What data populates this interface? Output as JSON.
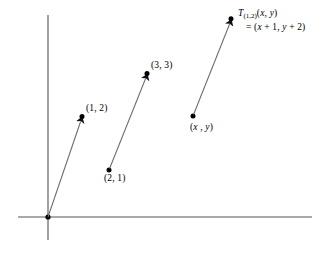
{
  "figure": {
    "background_color": "#ffffff",
    "axis_color": "#555555",
    "vector_color": "#666666",
    "point_color": "#000000",
    "text_color": "#000000",
    "width": 330,
    "height": 257
  },
  "axes": {
    "origin": {
      "x": 48,
      "y": 217
    },
    "x_axis": {
      "x1": 18,
      "y1": 217,
      "x2": 312,
      "y2": 217
    },
    "y_axis": {
      "x1": 48,
      "y1": 15,
      "x2": 48,
      "y2": 240
    }
  },
  "vectors": [
    {
      "name": "vector-origin-to-1-2",
      "start": {
        "x": 48,
        "y": 217
      },
      "end": {
        "x": 82,
        "y": 117
      },
      "start_label": "",
      "end_label": "(1, 2)"
    },
    {
      "name": "vector-2-1-to-3-3",
      "start": {
        "x": 109,
        "y": 170
      },
      "end": {
        "x": 147,
        "y": 74
      },
      "start_label": "(2, 1)",
      "end_label": "(3, 3)"
    },
    {
      "name": "vector-xy-to-image",
      "start": {
        "x": 193,
        "y": 116
      },
      "end": {
        "x": 231,
        "y": 19
      },
      "start_label": "(x , y)",
      "end_label": "T(1,2)(x, y) = (x + 1, y + 2)"
    }
  ],
  "labels": {
    "point_1_2": "(1, 2)",
    "point_3_3": "(3, 3)",
    "point_2_1": "(2, 1)",
    "point_x_y": {
      "open": "(",
      "x": "x",
      "sep": " , ",
      "y": "y",
      "close": ")"
    },
    "image_point": {
      "t": "T",
      "subscript": "(1,2)",
      "arg_open": "(",
      "arg_x": "x",
      "arg_sep": ", ",
      "arg_y": "y",
      "arg_close": ")",
      "equals": "=",
      "result_open": "(",
      "result_x": "x",
      "result_x_plus": " + 1, ",
      "result_y": "y",
      "result_y_plus": " + 2",
      "result_close": ")"
    }
  }
}
